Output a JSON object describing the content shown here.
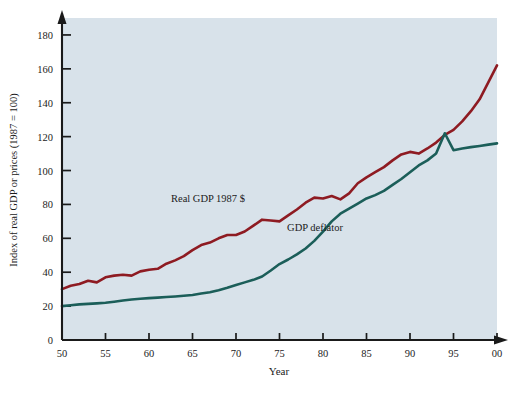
{
  "chart_data": {
    "type": "line",
    "title": "",
    "xlabel": "Year",
    "ylabel": "Index of real GDP or prices (1987 = 100)",
    "xlim": [
      50,
      100
    ],
    "ylim": [
      0,
      190
    ],
    "grid": false,
    "legend_position": "inline-annotations",
    "background_color": "#d8e2ea",
    "xtick_labels": [
      "50",
      "55",
      "60",
      "65",
      "70",
      "75",
      "80",
      "85",
      "90",
      "95",
      "00"
    ],
    "xtick_values": [
      50,
      55,
      60,
      65,
      70,
      75,
      80,
      85,
      90,
      95,
      100
    ],
    "ytick_labels": [
      "0",
      "20",
      "40",
      "60",
      "80",
      "100",
      "120",
      "140",
      "160",
      "180"
    ],
    "ytick_values": [
      0,
      20,
      40,
      60,
      80,
      100,
      120,
      140,
      160,
      180
    ],
    "x": [
      50,
      51,
      52,
      53,
      54,
      55,
      56,
      57,
      58,
      59,
      60,
      61,
      62,
      63,
      64,
      65,
      66,
      67,
      68,
      69,
      70,
      71,
      72,
      73,
      74,
      75,
      76,
      77,
      78,
      79,
      80,
      81,
      82,
      83,
      84,
      85,
      86,
      87,
      88,
      89,
      90,
      91,
      92,
      93,
      94,
      95,
      96,
      97,
      98,
      99,
      100
    ],
    "series": [
      {
        "name": "Real GDP 1987 $",
        "color": "#8e1b22",
        "label": "Real GDP 1987 $",
        "label_x": 70.5,
        "label_y": 88,
        "values": [
          30,
          32,
          33,
          35,
          34,
          37,
          38,
          38.5,
          38,
          40.5,
          41.5,
          42,
          45,
          47,
          49.5,
          53,
          56,
          57.5,
          60,
          62,
          62,
          64,
          67.5,
          71,
          70.5,
          70,
          73.5,
          77,
          81,
          84,
          83.5,
          85,
          83,
          86.5,
          92.5,
          96,
          99,
          102,
          106,
          109.5,
          111,
          110,
          113,
          116.5,
          121,
          124,
          129,
          135,
          142,
          152,
          162
        ]
      },
      {
        "name": "GDP deflator",
        "color": "#1b5e59",
        "label": "GDP deflator",
        "label_x": 79.5,
        "label_y": 70,
        "values": [
          20,
          20.5,
          21,
          21.3,
          21.6,
          22,
          22.6,
          23.3,
          23.9,
          24.3,
          24.7,
          25,
          25.4,
          25.7,
          26.1,
          26.6,
          27.4,
          28.2,
          29.4,
          30.8,
          32.4,
          34,
          35.5,
          37.5,
          41,
          44.8,
          47.5,
          50.5,
          54,
          58.5,
          64,
          70,
          74.5,
          77.5,
          80.5,
          83.5,
          85.5,
          88,
          91.5,
          95,
          99,
          103,
          106,
          110,
          122,
          112,
          113,
          113.8,
          114.5,
          115.3,
          116
        ]
      }
    ],
    "annotations": [
      {
        "text": "Real GDP 1987 $",
        "x_px": 208,
        "y_px": 202
      },
      {
        "text": "GDP deflator",
        "x_px": 315,
        "y_px": 231
      }
    ]
  },
  "axis_labels": {
    "x_title": "Year",
    "y_title": "Index of real GDP or prices (1987 = 100)"
  }
}
